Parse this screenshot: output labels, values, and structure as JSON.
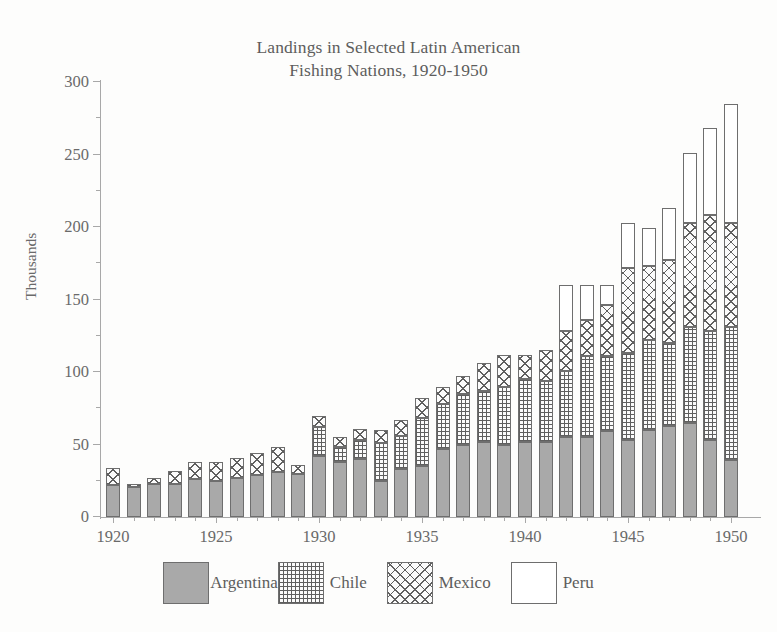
{
  "ghost_artifact": "scan bleed-through",
  "chart_data": {
    "type": "bar",
    "subtype": "stacked-bar",
    "title": "Landings in Selected Latin American Fishing Nations, 1920-1950",
    "title_lines": [
      "Landings in Selected Latin American",
      "Fishing Nations, 1920-1950"
    ],
    "xlabel": "",
    "ylabel": "Thousands",
    "ylim": [
      0,
      300
    ],
    "ytick_step": 50,
    "yminor_step": 25,
    "yticks": [
      0,
      50,
      100,
      150,
      200,
      250,
      300
    ],
    "ytick_labels": [
      "0",
      "50",
      "100",
      "150",
      "200",
      "250",
      "300"
    ],
    "xlim": [
      1920,
      1950
    ],
    "xtick_step": 5,
    "xticks": [
      1920,
      1925,
      1930,
      1935,
      1940,
      1945,
      1950
    ],
    "xtick_labels": [
      "1920",
      "1925",
      "1930",
      "1935",
      "1940",
      "1945",
      "1950"
    ],
    "grid": false,
    "legend_position": "bottom",
    "stack_order": [
      "Argentina",
      "Chile",
      "Mexico",
      "Peru"
    ],
    "categories": [
      1920,
      1921,
      1922,
      1923,
      1924,
      1925,
      1926,
      1927,
      1928,
      1929,
      1930,
      1931,
      1932,
      1933,
      1934,
      1935,
      1936,
      1937,
      1938,
      1939,
      1940,
      1941,
      1942,
      1943,
      1944,
      1945,
      1946,
      1947,
      1948,
      1949,
      1950
    ],
    "series": [
      {
        "name": "Argentina",
        "pattern": "solid-grey",
        "color": "#a9a9a9",
        "values": [
          22,
          21,
          23,
          23,
          26,
          25,
          27,
          29,
          31,
          30,
          42,
          38,
          40,
          25,
          33,
          35,
          47,
          50,
          52,
          50,
          52,
          52,
          55,
          55,
          59,
          53,
          60,
          63,
          65,
          53,
          39
        ]
      },
      {
        "name": "Chile",
        "pattern": "square-grid",
        "color": "#fbfbfb",
        "values": [
          0,
          0,
          0,
          0,
          0,
          0,
          0,
          0,
          0,
          0,
          20,
          10,
          13,
          26,
          23,
          33,
          31,
          35,
          35,
          40,
          43,
          42,
          46,
          56,
          52,
          60,
          62,
          57,
          66,
          75,
          92
        ]
      },
      {
        "name": "Mexico",
        "pattern": "diagonal-crosshatch",
        "color": "#fbfbfb",
        "values": [
          12,
          2,
          4,
          9,
          12,
          13,
          14,
          15,
          17,
          6,
          8,
          7,
          8,
          9,
          11,
          14,
          12,
          12,
          19,
          22,
          17,
          21,
          27,
          25,
          35,
          59,
          51,
          57,
          72,
          80,
          72
        ]
      },
      {
        "name": "Peru",
        "pattern": "empty-white",
        "color": "#ffffff",
        "values": [
          0,
          0,
          0,
          0,
          0,
          0,
          0,
          0,
          0,
          0,
          0,
          0,
          0,
          0,
          0,
          0,
          0,
          0,
          0,
          0,
          0,
          0,
          32,
          24,
          14,
          31,
          26,
          36,
          48,
          60,
          82
        ]
      }
    ],
    "totals": [
      34,
      23,
      27,
      32,
      38,
      38,
      41,
      44,
      48,
      36,
      70,
      55,
      61,
      60,
      67,
      82,
      90,
      97,
      106,
      112,
      112,
      115,
      160,
      160,
      160,
      203,
      199,
      213,
      251,
      268,
      285
    ],
    "annotations": []
  },
  "legend": {
    "items": [
      {
        "label": "Argentina",
        "pattern": "solid-grey"
      },
      {
        "label": "Chile",
        "pattern": "square-grid"
      },
      {
        "label": "Mexico",
        "pattern": "diagonal-crosshatch"
      },
      {
        "label": "Peru",
        "pattern": "empty-white"
      }
    ]
  }
}
